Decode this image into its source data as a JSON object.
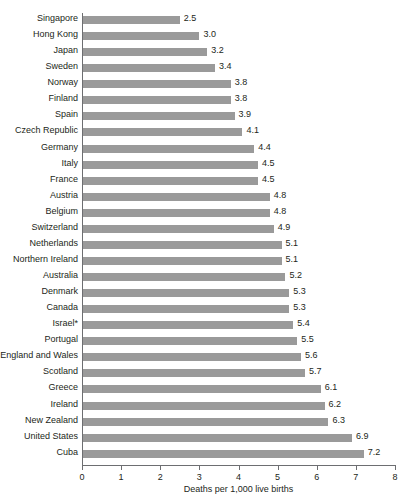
{
  "chart_data": {
    "type": "bar",
    "orientation": "horizontal",
    "title": "",
    "xlabel": "Deaths per 1,000 live births",
    "ylabel": "",
    "xlim": [
      0,
      8
    ],
    "xticks": [
      "0",
      "1",
      "2",
      "3",
      "4",
      "5",
      "6",
      "7",
      "8"
    ],
    "grid": false,
    "legend": null,
    "bar_color": "#9a9a9a",
    "axis_color": "#6d6e71",
    "categories": [
      "Singapore",
      "Hong Kong",
      "Japan",
      "Sweden",
      "Norway",
      "Finland",
      "Spain",
      "Czech Republic",
      "Germany",
      "Italy",
      "France",
      "Austria",
      "Belgium",
      "Switzerland",
      "Netherlands",
      "Northern Ireland",
      "Australia",
      "Denmark",
      "Canada",
      "Israel*",
      "Portugal",
      "England and Wales",
      "Scotland",
      "Greece",
      "Ireland",
      "New Zealand",
      "United States",
      "Cuba"
    ],
    "values": [
      2.5,
      3.0,
      3.2,
      3.4,
      3.8,
      3.8,
      3.9,
      4.1,
      4.4,
      4.5,
      4.5,
      4.8,
      4.8,
      4.9,
      5.1,
      5.1,
      5.2,
      5.3,
      5.3,
      5.4,
      5.5,
      5.6,
      5.7,
      6.1,
      6.2,
      6.3,
      6.9,
      7.2
    ],
    "value_labels": [
      "2.5",
      "3.0",
      "3.2",
      "3.4",
      "3.8",
      "3.8",
      "3.9",
      "4.1",
      "4.4",
      "4.5",
      "4.5",
      "4.8",
      "4.8",
      "4.9",
      "5.1",
      "5.1",
      "5.2",
      "5.3",
      "5.3",
      "5.4",
      "5.5",
      "5.6",
      "5.7",
      "6.1",
      "6.2",
      "6.3",
      "6.9",
      "7.2"
    ]
  }
}
